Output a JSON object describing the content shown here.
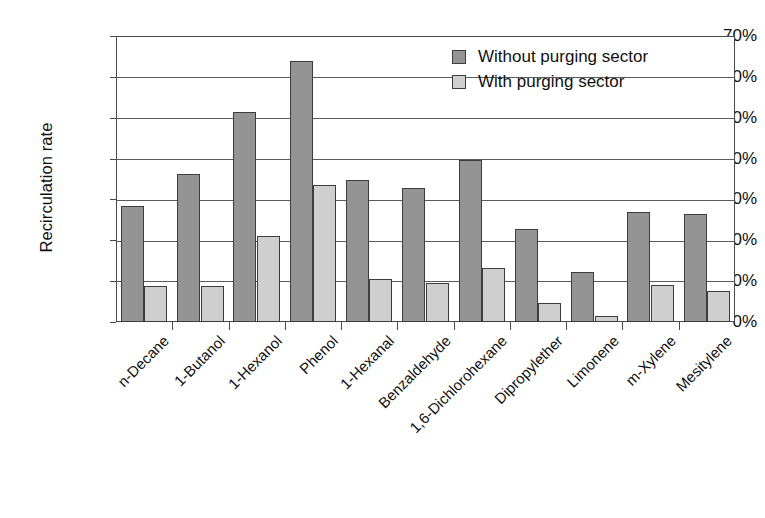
{
  "chart_data": {
    "type": "bar",
    "title": "",
    "xlabel": "",
    "ylabel": "Recirculation rate",
    "ylim": [
      0,
      70
    ],
    "ytick_labels": [
      "70%",
      "60%",
      "50%",
      "40%",
      "30%",
      "20%",
      "10%",
      "0%"
    ],
    "ytick_values": [
      70,
      60,
      50,
      40,
      30,
      20,
      10,
      0
    ],
    "grid": true,
    "legend_position": "top-right",
    "value_unit": "%",
    "categories": [
      "n-Decane",
      "1-Butanol",
      "1-Hexanol",
      "Phenol",
      "1-Hexanal",
      "Benzaldehyde",
      "1,6-Dichlorohexane",
      "Dipropylether",
      "Limonene",
      "m-Xylene",
      "Mesitylene"
    ],
    "series": [
      {
        "name": "Without purging sector",
        "color": "#949494",
        "values": [
          28.3,
          36.2,
          51.3,
          64.0,
          34.8,
          32.9,
          39.6,
          22.8,
          12.2,
          27.0,
          26.5
        ]
      },
      {
        "name": "With purging sector",
        "color": "#cfcfcf",
        "values": [
          8.9,
          8.8,
          21.0,
          33.6,
          10.5,
          9.6,
          13.2,
          4.6,
          1.5,
          9.0,
          7.7
        ]
      }
    ]
  },
  "legend": {
    "items": [
      {
        "label": "Without purging sector",
        "swatch": "dark"
      },
      {
        "label": "With purging sector",
        "swatch": "light"
      }
    ]
  }
}
